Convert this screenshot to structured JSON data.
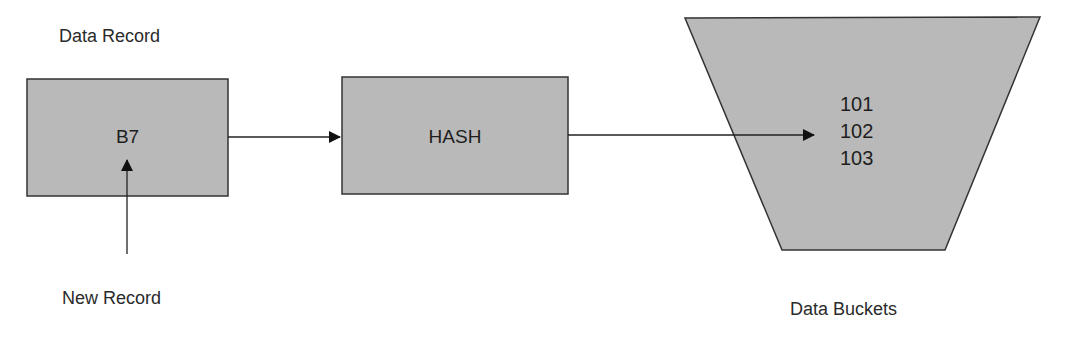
{
  "title_label": "Data Record",
  "record_box": {
    "value": "B7"
  },
  "hash_box": {
    "label": "HASH"
  },
  "buckets": {
    "items": [
      "101",
      "102",
      "103"
    ],
    "label": "Data Buckets"
  },
  "new_record_label": "New Record",
  "colors": {
    "fill": "#b9b9b9",
    "stroke": "#333333",
    "arrow": "#111111"
  }
}
